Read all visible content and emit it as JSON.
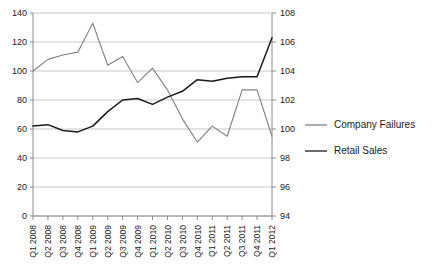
{
  "chart_data": {
    "type": "line",
    "title": "",
    "xlabel": "",
    "ylabel": "",
    "grid": true,
    "legend_position": "right",
    "categories": [
      "Q1 2008",
      "Q2 2008",
      "Q3 2008",
      "Q4 2008",
      "Q1 2009",
      "Q2 2009",
      "Q3 2009",
      "Q4 2009",
      "Q1 2010",
      "Q2 2010",
      "Q3 2010",
      "Q4 2010",
      "Q1 2011",
      "Q2 2011",
      "Q3 2011",
      "Q4 2011",
      "Q1 2012"
    ],
    "axes": {
      "left": {
        "min": 0,
        "max": 140,
        "step": 20,
        "ticks": [
          0,
          20,
          40,
          60,
          80,
          100,
          120,
          140
        ],
        "tick_labels": [
          "0",
          "20",
          "40",
          "60",
          "80",
          "100",
          "120",
          "140"
        ]
      },
      "right": {
        "min": 94,
        "max": 108,
        "step": 2,
        "ticks": [
          94,
          96,
          98,
          100,
          102,
          104,
          106,
          108
        ],
        "tick_labels": [
          "94",
          "96",
          "98",
          "100",
          "102",
          "104",
          "106",
          "108"
        ]
      }
    },
    "series": [
      {
        "name": "Company Failures",
        "axis": "left",
        "color": "#808080",
        "values": [
          100,
          108,
          111,
          113,
          133,
          104,
          110,
          92,
          102,
          87,
          67,
          51,
          62,
          55,
          87,
          87,
          55
        ]
      },
      {
        "name": "Retail Sales",
        "axis": "right",
        "color": "#1a1a1a",
        "values": [
          100.2,
          100.3,
          99.9,
          99.8,
          100.2,
          101.2,
          102.0,
          102.1,
          101.7,
          102.2,
          102.6,
          103.4,
          103.3,
          103.5,
          103.6,
          103.6,
          106.3
        ]
      }
    ]
  },
  "legend": {
    "items": [
      {
        "label": "Company Failures",
        "color": "#808080"
      },
      {
        "label": "Retail Sales",
        "color": "#1a1a1a"
      }
    ]
  },
  "colors": {
    "company_failures": "#808080",
    "retail_sales": "#1a1a1a",
    "grid": "#c9c9c9",
    "axis": "#8c8c8c",
    "text": "#1a1a1a",
    "background": "#ffffff"
  }
}
